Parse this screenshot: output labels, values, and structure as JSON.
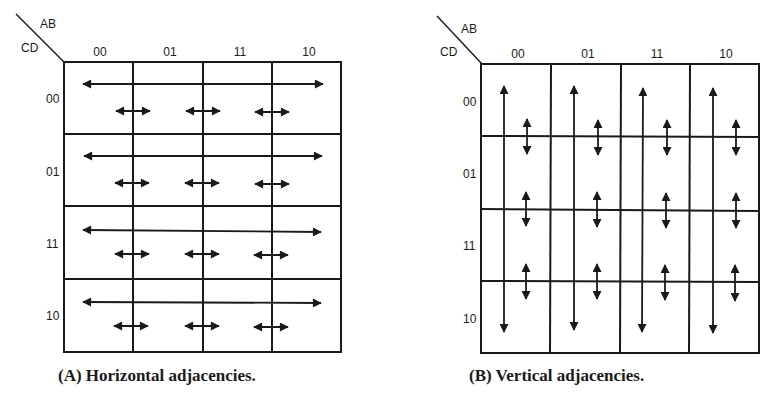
{
  "figure_a": {
    "corner_top": "AB",
    "corner_left": "CD",
    "col_labels": [
      "00",
      "01",
      "11",
      "10"
    ],
    "row_labels": [
      "00",
      "01",
      "11",
      "10"
    ],
    "caption": "(A) Horizontal adjacencies.",
    "arrow_direction": "horizontal"
  },
  "figure_b": {
    "corner_top": "AB",
    "corner_left": "CD",
    "col_labels": [
      "00",
      "01",
      "11",
      "10"
    ],
    "row_labels": [
      "00",
      "01",
      "11",
      "10"
    ],
    "caption": "(B) Vertical adjacencies.",
    "arrow_direction": "vertical"
  },
  "colors": {
    "ink": "#1a1a1a",
    "background": "#ffffff"
  }
}
